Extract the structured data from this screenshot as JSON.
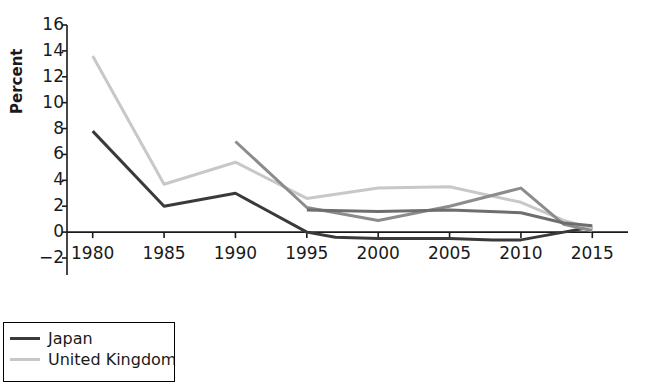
{
  "chart_data": {
    "type": "line",
    "title": "",
    "xlabel": "",
    "ylabel": "Percent",
    "xlim": [
      1978.2,
      2017.5
    ],
    "ylim": [
      -2,
      16
    ],
    "yticks": [
      -2,
      0,
      2,
      4,
      6,
      8,
      10,
      12,
      14,
      16
    ],
    "ytick_labels": [
      "−2",
      "0",
      "2",
      "4",
      "6",
      "8",
      "10",
      "12",
      "14",
      "16"
    ],
    "xticks": [
      1980,
      1985,
      1990,
      1995,
      2000,
      2005,
      2010,
      2015
    ],
    "xtick_labels": [
      "1980",
      "1985",
      "1990",
      "1995",
      "2000",
      "2005",
      "2010",
      "2015"
    ],
    "grid": false,
    "legend_position": "below-left",
    "series": [
      {
        "name": "Japan",
        "color": "#3a3a3a",
        "width": 3.0,
        "x": [
          1980,
          1985,
          1990,
          1995,
          1997,
          2000,
          2005,
          2008,
          2010,
          2013,
          2015
        ],
        "values": [
          7.8,
          2.0,
          3.0,
          0.0,
          -0.4,
          -0.5,
          -0.5,
          -0.6,
          -0.6,
          0.0,
          0.4
        ]
      },
      {
        "name": "United Kingdom",
        "color": "#c8c8c8",
        "width": 3.0,
        "x": [
          1980,
          1985,
          1990,
          1995,
          2000,
          2005,
          2010,
          2013,
          2015
        ],
        "values": [
          13.6,
          3.7,
          5.4,
          2.6,
          3.4,
          3.5,
          2.3,
          0.9,
          0.3
        ]
      },
      {
        "name": "",
        "color": "#8c8c8c",
        "width": 3.0,
        "x": [
          1990,
          1995,
          2000,
          2005,
          2010,
          2013,
          2015
        ],
        "values": [
          7.0,
          1.9,
          0.9,
          2.0,
          3.4,
          0.6,
          0.1
        ]
      },
      {
        "name": "",
        "color": "#6e6e6e",
        "width": 3.0,
        "x": [
          1995,
          2000,
          2005,
          2010,
          2013,
          2015
        ],
        "values": [
          1.7,
          1.6,
          1.7,
          1.5,
          0.7,
          0.5
        ]
      }
    ]
  },
  "legend": {
    "entries": [
      {
        "label": "Japan",
        "color": "#3a3a3a"
      },
      {
        "label": "United Kingdom",
        "color": "#c8c8c8"
      }
    ]
  }
}
